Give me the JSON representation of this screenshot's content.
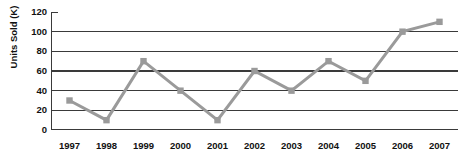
{
  "chart_data": {
    "type": "line",
    "title": "",
    "xlabel": "",
    "ylabel": "Units Sold (K)",
    "categories": [
      "1997",
      "1998",
      "1999",
      "2000",
      "2001",
      "2002",
      "2003",
      "2004",
      "2005",
      "2006",
      "2007"
    ],
    "values": [
      30,
      10,
      70,
      40,
      10,
      60,
      40,
      70,
      50,
      100,
      110
    ],
    "series": [
      {
        "name": "Units Sold",
        "values": [
          30,
          10,
          70,
          40,
          10,
          60,
          40,
          70,
          50,
          100,
          110
        ]
      }
    ],
    "ylim": [
      0,
      120
    ],
    "yticks": [
      0,
      20,
      40,
      60,
      80,
      100,
      120
    ],
    "ytick_labels": [
      "0",
      "20",
      "40",
      "60",
      "80",
      "100",
      "120"
    ],
    "grid": true,
    "grid_axis": "y",
    "legend": false,
    "legend_position": "none",
    "marker": "square",
    "line_color": "#9a9a9a",
    "marker_color": "#9a9a9a",
    "grid_color": "#3a3a3a",
    "axis_color": "#3a3a3a",
    "text_color": "#111111"
  },
  "axes": {
    "y_title": "Units Sold (K)"
  }
}
